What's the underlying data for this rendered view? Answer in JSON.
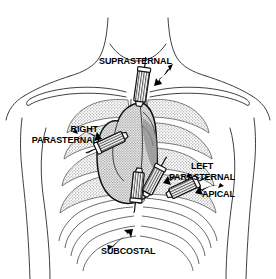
{
  "figure": {
    "background_color": "#ffffff",
    "ink_color": "#000000",
    "shading_color": "#b5b5b5",
    "heart_shading_color": "#9a9a9a"
  },
  "labels": {
    "suprasternal": "SUPRASTERNAL",
    "right_parasternal_line1": "RIGHT",
    "right_parasternal_line2": "PARASTERNAL",
    "left_parasternal_line1": "LEFT",
    "left_parasternal_line2": "PARASTERNAL",
    "apical": "APICAL",
    "subcostal": "SUBCOSTAL"
  },
  "anatomy": {
    "neck": "neck",
    "clavicle_left": "left-clavicle",
    "clavicle_right": "right-clavicle",
    "shoulder_left": "left-shoulder",
    "shoulder_right": "right-shoulder",
    "torso": "torso-outline",
    "ribcage": "ribcage",
    "sternum": "sternum",
    "heart": "heart-silhouette",
    "costal_margin": "costal-margin"
  },
  "transducers": [
    {
      "id": "suprasternal",
      "label": "SUPRASTERNAL",
      "angle_deg": 8,
      "window": "suprasternal notch"
    },
    {
      "id": "right-parasternal",
      "label": "RIGHT PARASTERNAL",
      "angle_deg": -22,
      "window": "right parasternal border"
    },
    {
      "id": "left-parasternal",
      "label": "LEFT PARASTERNAL",
      "angle_deg": 34,
      "window": "left parasternal border"
    },
    {
      "id": "apical",
      "label": "APICAL",
      "angle_deg": -25,
      "window": "cardiac apex"
    },
    {
      "id": "subcostal",
      "label": "SUBCOSTAL",
      "angle_deg": 6,
      "window": "subxiphoid / subcostal"
    }
  ],
  "arrows": [
    {
      "id": "arrow-suprasternal",
      "points_to": "suprasternal"
    },
    {
      "id": "arrow-right-parasternal",
      "points_to": "right-parasternal"
    },
    {
      "id": "arrow-left-parasternal",
      "points_to": "left-parasternal"
    },
    {
      "id": "arrow-apical",
      "points_to": "apical"
    },
    {
      "id": "arrow-subcostal",
      "points_to": "subcostal"
    }
  ]
}
